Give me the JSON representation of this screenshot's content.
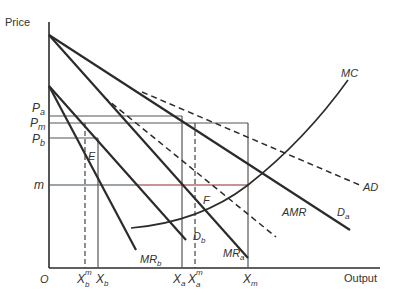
{
  "diagram": {
    "axes": {
      "y_label": "Price",
      "x_label": "Output",
      "origin_label": "O"
    },
    "price_levels": [
      {
        "id": "pa",
        "base": "P",
        "sub": "a"
      },
      {
        "id": "pm",
        "base": "P",
        "sub": "m"
      },
      {
        "id": "pb",
        "base": "P",
        "sub": "b"
      },
      {
        "id": "m",
        "base": "m",
        "sub": ""
      }
    ],
    "output_levels": [
      {
        "id": "xbm",
        "base": "X",
        "sub": "b",
        "sup": "m"
      },
      {
        "id": "xb",
        "base": "X",
        "sub": "b",
        "sup": ""
      },
      {
        "id": "xa",
        "base": "X",
        "sub": "a",
        "sup": ""
      },
      {
        "id": "xam",
        "base": "X",
        "sub": "a",
        "sup": "m"
      },
      {
        "id": "xm",
        "base": "X",
        "sub": "m",
        "sup": ""
      }
    ],
    "curves": [
      {
        "id": "mc",
        "base": "MC",
        "sub": "",
        "style": "solid"
      },
      {
        "id": "ad",
        "base": "AD",
        "sub": "",
        "style": "dashed"
      },
      {
        "id": "amr",
        "base": "AMR",
        "sub": "",
        "style": "dashed"
      },
      {
        "id": "da",
        "base": "D",
        "sub": "a",
        "style": "solid"
      },
      {
        "id": "db",
        "base": "D",
        "sub": "b",
        "style": "solid"
      },
      {
        "id": "mra",
        "base": "MR",
        "sub": "a",
        "style": "solid"
      },
      {
        "id": "mrb",
        "base": "MR",
        "sub": "b",
        "style": "solid"
      }
    ],
    "points": [
      {
        "id": "e",
        "label": "E"
      },
      {
        "id": "f",
        "label": "F"
      }
    ],
    "colors": {
      "ink": "#2b2b2b",
      "guide": "#555555",
      "m_line_left": "#3d4a55",
      "m_line_right": "#8b2a2a"
    }
  }
}
